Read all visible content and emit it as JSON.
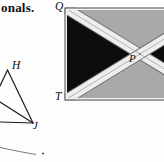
{
  "page": {
    "background": "#fdfdfd",
    "text_fragment": "onals."
  },
  "triangle_figure": {
    "vertex_h_label": "H",
    "vertex_j_label": "J",
    "line_color": "#1c1c1c"
  },
  "flag_figure": {
    "corner_q_label": "Q",
    "corner_t_label": "T",
    "center_p_label": "P",
    "colors": {
      "gray_panel": "#a9a9a9",
      "black_panel": "#0d0d0d",
      "band_white": "#eeeeee",
      "band_edge": "#6f6f6f",
      "center_line": "#9a9a9a",
      "border": "#4a4a4a"
    }
  },
  "bottom_figure": {
    "line_color": "#6e6e6e"
  }
}
